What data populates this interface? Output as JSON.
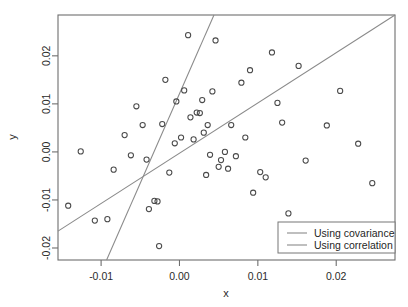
{
  "chart_data": {
    "type": "scatter",
    "title": "",
    "xlabel": "x",
    "ylabel": "y",
    "xlim": [
      -0.0155,
      0.0275
    ],
    "ylim": [
      -0.0225,
      0.0285
    ],
    "grid": false,
    "legend_position": "bottom-right",
    "xticks": [
      -0.01,
      0.0,
      0.01,
      0.02
    ],
    "xticklabels": [
      "-0.01",
      "0.00",
      "0.01",
      "0.02"
    ],
    "yticks": [
      0.02,
      0.01,
      0.0,
      -0.01,
      -0.02
    ],
    "yticklabels": [
      "0.02",
      "0.01",
      "0.00",
      "-0.01",
      "-0.02"
    ],
    "marker": "open-circle",
    "point_color": "#4a4a4a",
    "line_color": "#8a8a8a",
    "points": [
      {
        "x": -0.0142,
        "y": -0.0112
      },
      {
        "x": -0.0126,
        "y": 0.0001
      },
      {
        "x": -0.0108,
        "y": -0.0143
      },
      {
        "x": -0.0092,
        "y": -0.014
      },
      {
        "x": -0.0084,
        "y": -0.0037
      },
      {
        "x": -0.007,
        "y": 0.0035
      },
      {
        "x": -0.0062,
        "y": -0.0007
      },
      {
        "x": -0.0055,
        "y": 0.0095
      },
      {
        "x": -0.0047,
        "y": 0.0056
      },
      {
        "x": -0.0042,
        "y": -0.0016
      },
      {
        "x": -0.0039,
        "y": -0.0119
      },
      {
        "x": -0.0032,
        "y": -0.0102
      },
      {
        "x": -0.0028,
        "y": -0.0103
      },
      {
        "x": -0.0026,
        "y": -0.0196
      },
      {
        "x": -0.0022,
        "y": 0.0058
      },
      {
        "x": -0.0018,
        "y": 0.015
      },
      {
        "x": -0.0013,
        "y": -0.0043
      },
      {
        "x": -0.0006,
        "y": 0.0018
      },
      {
        "x": -0.0004,
        "y": 0.0105
      },
      {
        "x": 0.0002,
        "y": 0.003
      },
      {
        "x": 0.0006,
        "y": 0.0128
      },
      {
        "x": 0.0011,
        "y": 0.0243
      },
      {
        "x": 0.0014,
        "y": 0.0072
      },
      {
        "x": 0.0018,
        "y": 0.0026
      },
      {
        "x": 0.0022,
        "y": 0.0082
      },
      {
        "x": 0.0026,
        "y": 0.0081
      },
      {
        "x": 0.0029,
        "y": 0.0108
      },
      {
        "x": 0.0031,
        "y": 0.004
      },
      {
        "x": 0.0034,
        "y": -0.0048
      },
      {
        "x": 0.0036,
        "y": 0.0056
      },
      {
        "x": 0.0039,
        "y": -0.0006
      },
      {
        "x": 0.0042,
        "y": 0.0126
      },
      {
        "x": 0.0046,
        "y": 0.0232
      },
      {
        "x": 0.005,
        "y": -0.0031
      },
      {
        "x": 0.0053,
        "y": -0.0017
      },
      {
        "x": 0.0058,
        "y": 0.0
      },
      {
        "x": 0.0062,
        "y": -0.0035
      },
      {
        "x": 0.0066,
        "y": 0.0056
      },
      {
        "x": 0.0072,
        "y": -0.0009
      },
      {
        "x": 0.0079,
        "y": 0.0144
      },
      {
        "x": 0.0084,
        "y": 0.003
      },
      {
        "x": 0.009,
        "y": 0.017
      },
      {
        "x": 0.0094,
        "y": -0.0085
      },
      {
        "x": 0.0103,
        "y": -0.0042
      },
      {
        "x": 0.011,
        "y": -0.0053
      },
      {
        "x": 0.0118,
        "y": 0.0207
      },
      {
        "x": 0.0125,
        "y": 0.0102
      },
      {
        "x": 0.0131,
        "y": 0.0061
      },
      {
        "x": 0.0139,
        "y": -0.0128
      },
      {
        "x": 0.0152,
        "y": 0.0179
      },
      {
        "x": 0.0161,
        "y": -0.0018
      },
      {
        "x": 0.0188,
        "y": 0.0055
      },
      {
        "x": 0.0205,
        "y": 0.0127
      },
      {
        "x": 0.0228,
        "y": 0.0017
      },
      {
        "x": 0.0246,
        "y": -0.0065
      }
    ],
    "lines": [
      {
        "name": "Using covariance",
        "x0": -0.0093,
        "y0": -0.0225,
        "x1": 0.0044,
        "y1": 0.0285
      },
      {
        "name": "Using correlation",
        "x0": -0.0155,
        "y0": -0.0165,
        "x1": 0.0275,
        "y1": 0.0285
      }
    ],
    "legend": [
      {
        "label": "Using covariance"
      },
      {
        "label": "Using correlation"
      }
    ]
  }
}
